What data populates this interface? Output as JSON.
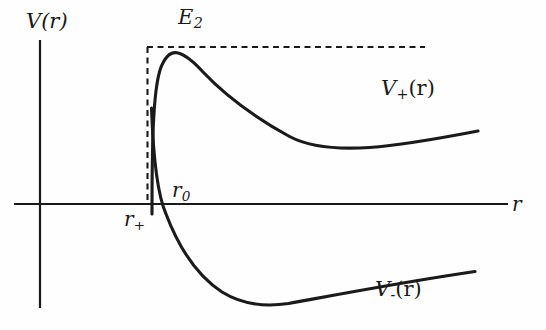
{
  "figure": {
    "background_color": "#fefefe",
    "ink_color": "#1a1a1a"
  },
  "axes": {
    "vertical": {
      "label": "V(r)",
      "label_base": "V",
      "label_arg": "(r)",
      "x": 40,
      "y_top": 40,
      "y_bottom": 308
    },
    "horizontal": {
      "label": "r",
      "y": 204,
      "x_left": 14,
      "x_right": 508
    },
    "origin": {
      "x": 40,
      "y": 204
    }
  },
  "annotations": {
    "energy_level": {
      "label_base": "E",
      "label_sub": "2",
      "label": "E2",
      "y": 47,
      "x_start": 147,
      "x_end": 425,
      "style": "dashed"
    },
    "barrier_line": {
      "x": 147,
      "y_top": 47,
      "y_bottom": 204,
      "style": "dashed"
    },
    "r_zero": {
      "label_base": "r",
      "label_sub": "0",
      "label": "r0",
      "x": 163,
      "y": 204
    },
    "r_plus": {
      "label_base": "r",
      "label_sup": "+",
      "label": "r+",
      "x": 147,
      "y": 204
    }
  },
  "curves": [
    {
      "name": "V_plus",
      "label_base": "V",
      "label_sup": "+",
      "label_arg": "(r)",
      "label": "V+(r)",
      "style": "solid",
      "path": "M 152 214 C 152 150, 153 90, 161 68 C 166 55, 171 52, 177 53 C 186 55, 194 62, 204 73 C 222 92, 246 113, 290 137 L 478 131",
      "peak": {
        "x": 177,
        "y": 53
      },
      "end": {
        "x": 478,
        "y": 131
      }
    },
    {
      "name": "V_minus",
      "label_base": "V",
      "label_sup": "-",
      "label_arg": "(r)",
      "label": "V-(r)",
      "style": "solid",
      "path": "M 152 110 C 154 165, 158 195, 166 214 C 178 245, 196 275, 222 292 C 240 303, 262 307, 288 303 C 330 296, 400 282, 475 272",
      "minimum": {
        "x": 258,
        "y": 304
      },
      "end": {
        "x": 475,
        "y": 272
      }
    }
  ]
}
